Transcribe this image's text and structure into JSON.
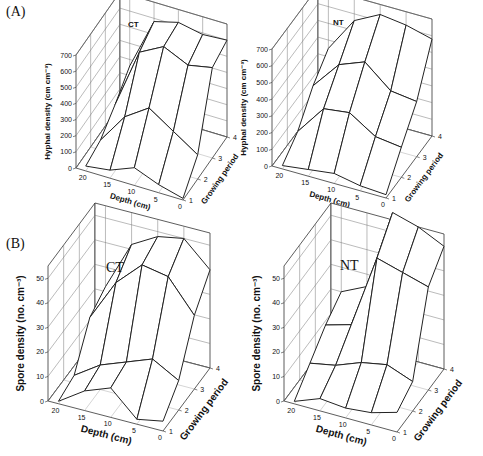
{
  "figure": {
    "panel_labels": [
      "(A)",
      "(B)"
    ]
  },
  "chart_data": [
    {
      "panel": "A",
      "treatment": "CT",
      "type": "surface3d",
      "title": "CT",
      "zlabel": "Hyphal density (cm cm-3)",
      "xlabel": "Depth (cm)",
      "ylabel": "Growing period",
      "x_ticks": [
        20,
        15,
        10,
        5,
        0
      ],
      "y_ticks": [
        1,
        2,
        3,
        4
      ],
      "z_ticks": [
        0,
        100,
        200,
        300,
        400,
        500,
        600,
        700
      ],
      "zlim": [
        0,
        700
      ],
      "grid": true,
      "depth": [
        20,
        15,
        10,
        5,
        0
      ],
      "growing_period": [
        1,
        2,
        3,
        4
      ],
      "values": [
        [
          30,
          60,
          150,
          260
        ],
        [
          50,
          250,
          520,
          580
        ],
        [
          110,
          350,
          600,
          620
        ],
        [
          50,
          250,
          530,
          590
        ],
        [
          10,
          150,
          560,
          600
        ]
      ]
    },
    {
      "panel": "A",
      "treatment": "NT",
      "type": "surface3d",
      "title": "NT",
      "zlabel": "Hyphal density (cm cm-3)",
      "xlabel": "Depth (cm)",
      "ylabel": "Growing period",
      "x_ticks": [
        20,
        15,
        10,
        5,
        0
      ],
      "y_ticks": [
        1,
        2,
        3,
        4
      ],
      "z_ticks": [
        0,
        100,
        200,
        300,
        400,
        500,
        600,
        700
      ],
      "zlim": [
        0,
        700
      ],
      "grid": true,
      "depth": [
        20,
        15,
        10,
        5,
        0
      ],
      "growing_period": [
        1,
        2,
        3,
        4
      ],
      "values": [
        [
          20,
          100,
          250,
          350
        ],
        [
          40,
          280,
          420,
          560
        ],
        [
          60,
          300,
          480,
          640
        ],
        [
          30,
          200,
          350,
          620
        ],
        [
          20,
          180,
          330,
          580
        ]
      ]
    },
    {
      "panel": "B",
      "treatment": "CT",
      "type": "surface3d",
      "title": "CT",
      "zlabel": "Spore density (no. cm-3)",
      "xlabel": "Depth (cm)",
      "ylabel": "Growing period",
      "x_ticks": [
        20,
        15,
        10,
        5,
        0
      ],
      "y_ticks": [
        1,
        2,
        3,
        4
      ],
      "z_ticks": [
        0,
        10,
        20,
        30,
        40,
        50
      ],
      "zlim": [
        0,
        55
      ],
      "grid": true,
      "depth": [
        20,
        15,
        10,
        5,
        0
      ],
      "growing_period": [
        1,
        2,
        3,
        4
      ],
      "values": [
        [
          1,
          3,
          18,
          22
        ],
        [
          8,
          10,
          35,
          42
        ],
        [
          12,
          14,
          45,
          48
        ],
        [
          2,
          18,
          43,
          50
        ],
        [
          4,
          12,
          30,
          40
        ]
      ]
    },
    {
      "panel": "B",
      "treatment": "NT",
      "type": "surface3d",
      "title": "NT",
      "zlabel": "Spore density (no. cm-3)",
      "xlabel": "Depth (cm)",
      "ylabel": "Growing period",
      "x_ticks": [
        20,
        15,
        10,
        5,
        0
      ],
      "y_ticks": [
        1,
        2,
        3,
        4
      ],
      "z_ticks": [
        0,
        10,
        20,
        30,
        40,
        50
      ],
      "zlim": [
        0,
        55
      ],
      "grid": true,
      "depth": [
        20,
        15,
        10,
        5,
        0
      ],
      "growing_period": [
        1,
        2,
        3,
        4
      ],
      "values": [
        [
          1,
          8,
          15,
          20
        ],
        [
          5,
          10,
          18,
          25
        ],
        [
          4,
          14,
          48,
          58
        ],
        [
          5,
          16,
          45,
          55
        ],
        [
          8,
          12,
          42,
          50
        ]
      ]
    }
  ]
}
